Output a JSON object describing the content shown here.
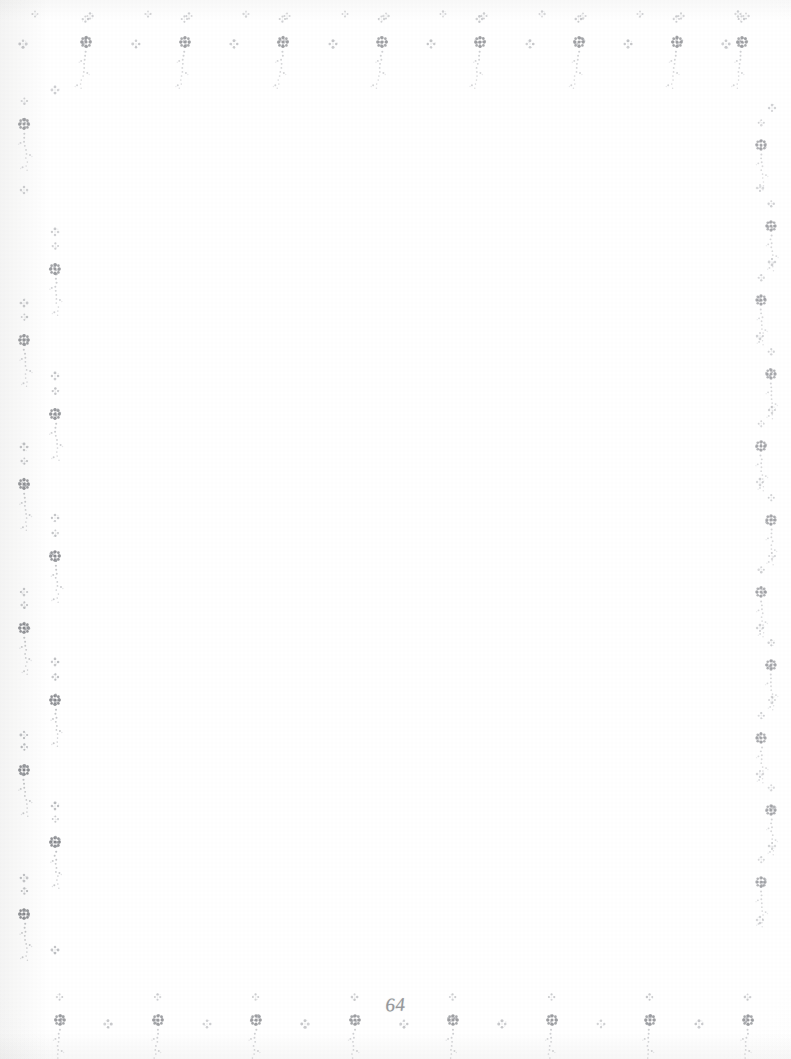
{
  "document": {
    "type": "scanned-book-page",
    "page_number": "64",
    "body_text": "",
    "description": "Blank book page with a pointillist floral sprig border on all four edges",
    "page_width": 791,
    "page_height": 1059
  },
  "colors": {
    "paper": "#ffffff",
    "paper_edge_tone": "#f6f6f5",
    "ink_dark": "#6d6f74",
    "ink_mid": "#9a9ca1",
    "ink_light": "#c2c4c8",
    "page_number_ink": "#8d8f93"
  },
  "border": {
    "motif_names": [
      "floral-sprig-motif",
      "dot-cluster-motif"
    ],
    "top": {
      "large_sprigs_x": [
        86,
        185,
        283,
        382,
        480,
        579,
        677,
        742
      ],
      "small_clusters_x": [
        23,
        136,
        234,
        333,
        431,
        530,
        628,
        726
      ],
      "baseline_y": 42,
      "top_cluster_y": 14
    },
    "bottom": {
      "large_sprigs_x": [
        60,
        158,
        256,
        355,
        453,
        552,
        650,
        748
      ],
      "small_clusters_x": [
        108,
        207,
        305,
        404,
        502,
        601,
        699
      ],
      "baseline_y": 1020
    },
    "left": {
      "outer_column_x": 24,
      "inner_column_x": 55,
      "large_sprig_y": [
        124,
        269,
        340,
        414,
        484,
        556,
        628,
        700,
        770,
        842,
        914
      ],
      "small_cluster_y": [
        90,
        190,
        232,
        303,
        376,
        447,
        518,
        592,
        662,
        735,
        806,
        878,
        950
      ]
    },
    "right": {
      "column_x": 765,
      "large_sprig_y": [
        145,
        226,
        300,
        374,
        446,
        520,
        592,
        665,
        738,
        810,
        882
      ],
      "small_cluster_y": [
        108,
        188,
        262,
        336,
        410,
        482,
        556,
        628,
        700,
        774,
        846,
        920
      ]
    }
  },
  "page_number_display": {
    "label": "64",
    "position": "bottom-center"
  }
}
